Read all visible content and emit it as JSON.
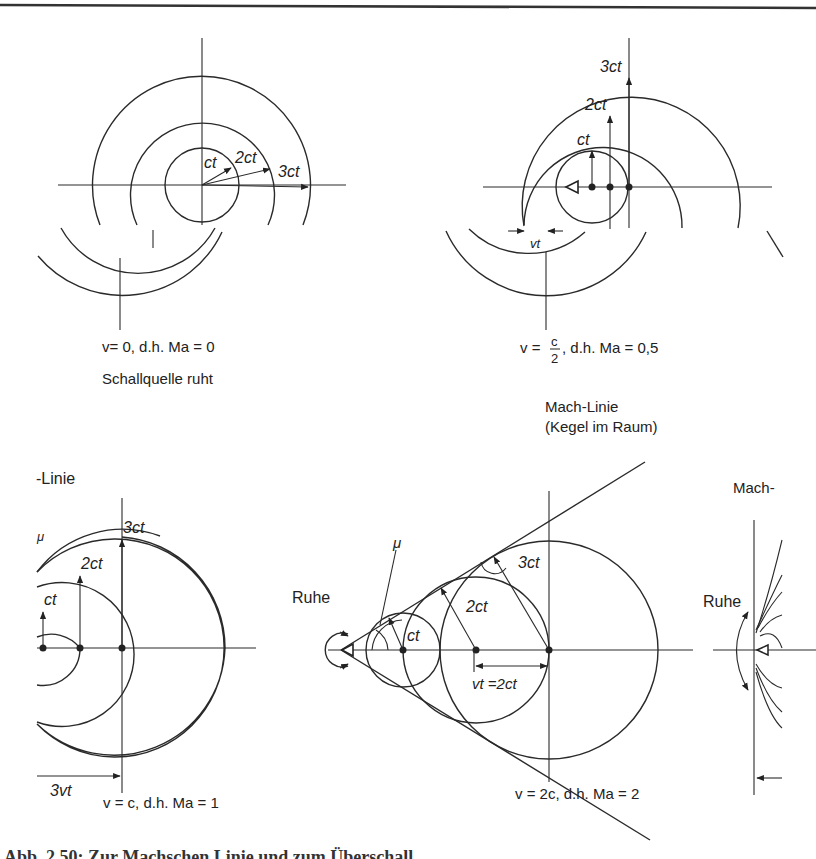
{
  "figure": {
    "top_rule": true,
    "panels": [
      {
        "id": "ma0",
        "labels": {
          "r1": "ct",
          "r2": "2ct",
          "r3": "3ct"
        },
        "condition": "v= 0,  d.h. Ma = 0",
        "note": "Schallquelle ruht"
      },
      {
        "id": "ma05",
        "labels": {
          "r1": "ct",
          "r2": "2ct",
          "r3": "3ct",
          "shift": "vt"
        },
        "condition_prefix": "v = ",
        "fraction_num": "c",
        "fraction_den": "2",
        "condition_suffix": ", d.h. Ma = 0,5"
      },
      {
        "id": "ma1",
        "labels": {
          "r1": "ct",
          "r2": "2ct",
          "r3": "3ct",
          "shift": "3vt",
          "mu": "μ",
          "mach_line": "-Linie"
        },
        "condition": "v = c,  d.h. Ma = 1"
      },
      {
        "id": "ma2",
        "labels": {
          "r1": "ct",
          "r2": "2ct",
          "r3": "3ct",
          "shift": "vt =2ct",
          "mu": "μ",
          "rest": "Ruhe",
          "mach_line": "Mach-Linie",
          "mach_cone": "(Kegel im Raum)"
        },
        "condition": "v = 2c,  d.h. Ma = 2"
      },
      {
        "id": "ma_high",
        "labels": {
          "rest": "Ruhe",
          "mach_line": "Mach-"
        }
      }
    ],
    "caption": "Abb. 2.50: Zur Machschen Linie und zum Überschall"
  }
}
